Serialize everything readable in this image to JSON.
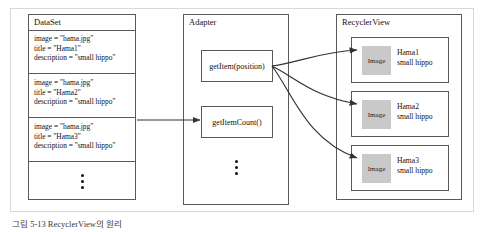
{
  "figure": {
    "caption": "그림 5-13 RecyclerView의 원리",
    "line_color": "#5a5a5a",
    "frame_color": "#d9d9d9",
    "thumb_color": "#c9c9c9"
  },
  "dataset": {
    "title": "DataSet",
    "items": [
      {
        "image": "image = \"hama.jpg\"",
        "title": "title = \"Hama1\"",
        "description": "description = \"small hippo\""
      },
      {
        "image": "image = \"hama.jpg\"",
        "title": "title = \"Hama2\"",
        "description": "description = \"small hippo\""
      },
      {
        "image": "image = \"hama.jpg\"",
        "title": "title = \"Hama3\"",
        "description": "description = \"small hippo\""
      }
    ],
    "ellipsis": "vertical-ellipsis"
  },
  "adapter": {
    "title": "Adapter",
    "methods": [
      {
        "label": "getItem(position)"
      },
      {
        "label": "getItemCount()"
      }
    ],
    "ellipsis": "vertical-ellipsis"
  },
  "recyclerview": {
    "title": "RecyclerView",
    "items": [
      {
        "thumb_label": "Image",
        "title": "Hama1",
        "description": "small hippo"
      },
      {
        "thumb_label": "Image",
        "title": "Hama2",
        "description": "small hippo"
      },
      {
        "thumb_label": "Image",
        "title": "Hama3",
        "description": "small hippo"
      }
    ]
  }
}
